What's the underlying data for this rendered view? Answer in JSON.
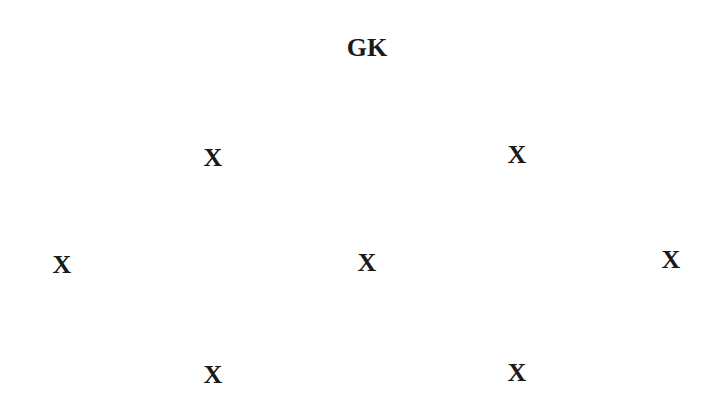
{
  "formation": {
    "goalkeeper": {
      "label": "GK",
      "x": 367,
      "y": 48
    },
    "players": [
      {
        "label": "X",
        "x": 213,
        "y": 158
      },
      {
        "label": "X",
        "x": 517,
        "y": 155
      },
      {
        "label": "X",
        "x": 62,
        "y": 265
      },
      {
        "label": "X",
        "x": 367,
        "y": 263
      },
      {
        "label": "X",
        "x": 671,
        "y": 260
      },
      {
        "label": "X",
        "x": 213,
        "y": 375
      },
      {
        "label": "X",
        "x": 517,
        "y": 373
      }
    ]
  }
}
